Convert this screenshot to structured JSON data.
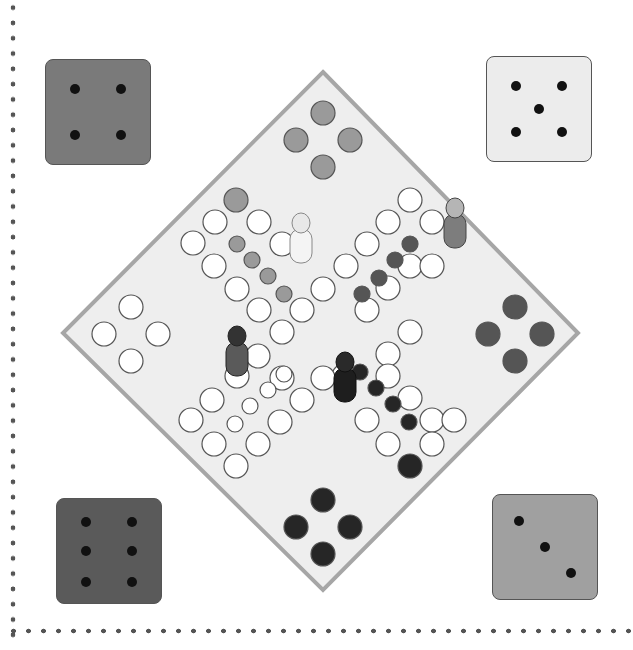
{
  "game": {
    "type": "ludo-style board game",
    "colors": {
      "background": "#ffffff",
      "board_fill": "#eeeeee",
      "board_edge": "#a6a6a6",
      "empty_space": "#ffffff",
      "space_outline": "#555555",
      "player_top": "#9a9a9a",
      "player_right": "#555555",
      "player_bottom": "#262626",
      "player_left": "#ffffff",
      "die_top_left": "#7a7a7a",
      "die_top_right": "#ececec",
      "die_bottom_left": "#5a5a5a",
      "die_bottom_right": "#a0a0a0",
      "pip": "#111111",
      "border_dots": "#555555"
    },
    "dice": [
      {
        "position": "top-left",
        "value": 4,
        "color": "#7a7a7a",
        "x": 45,
        "y": 59
      },
      {
        "position": "top-right",
        "value": 5,
        "color": "#ececec",
        "x": 486,
        "y": 56
      },
      {
        "position": "bottom-left",
        "value": 6,
        "color": "#5a5a5a",
        "x": 56,
        "y": 498
      },
      {
        "position": "bottom-right",
        "value": 3,
        "color": "#a0a0a0",
        "x": 492,
        "y": 494
      }
    ],
    "pieces": [
      {
        "name": "light-figure-dotted-dress",
        "color": "light",
        "x": 301,
        "y": 241
      },
      {
        "name": "striped-figure",
        "color": "medium",
        "x": 455,
        "y": 226
      },
      {
        "name": "dark-figure-hat",
        "color": "dark-gray",
        "x": 237,
        "y": 354
      },
      {
        "name": "black-figure-tie",
        "color": "black",
        "x": 345,
        "y": 380
      }
    ]
  }
}
